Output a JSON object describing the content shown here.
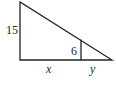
{
  "diagram": {
    "type": "similar-triangles",
    "labels": {
      "outer_height": "15",
      "inner_height": "6",
      "base_left": "x",
      "base_right": "y"
    },
    "colors": {
      "stroke": "#222222",
      "background": "#ffffff"
    }
  }
}
